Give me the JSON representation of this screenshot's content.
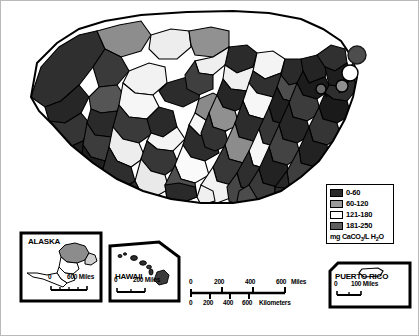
{
  "map": {
    "title": "Water hardness of the United States",
    "subject": "mg CaCO3/L H2O",
    "background_color": "#ffffff",
    "outline_color": "#000000"
  },
  "legend": {
    "name": "water-hardness-legend",
    "units_label": "mg CaCO",
    "units_sub1": "3",
    "units_mid": "/L H",
    "units_sub2": "2",
    "units_end": "O",
    "classes": [
      {
        "label": "0-60",
        "color": "#2b2b2b"
      },
      {
        "label": "60-120",
        "color": "#9a9a9a"
      },
      {
        "label": "121-180",
        "color": "#ffffff"
      },
      {
        "label": "181-250",
        "color": "#5e5e5e"
      }
    ]
  },
  "insets": [
    {
      "id": "alaska",
      "title": "ALASKA",
      "scale": {
        "zero": "0",
        "max": "600 Miles"
      }
    },
    {
      "id": "hawaii",
      "title": "HAWAII",
      "scale": {
        "zero": "0",
        "max": "200 Miles"
      }
    },
    {
      "id": "puerto-rico",
      "title": "PUERTO RICO",
      "scale": {
        "zero": "0",
        "max": "100 Miles"
      }
    }
  ],
  "main_scale": {
    "miles": {
      "unit": "Miles",
      "ticks": [
        "0",
        "200",
        "400",
        "600"
      ]
    },
    "kilometers": {
      "unit": "Kilometers",
      "ticks": [
        "0",
        "200",
        "400",
        "600"
      ]
    }
  }
}
